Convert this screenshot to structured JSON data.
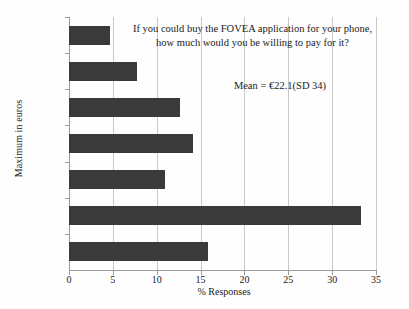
{
  "chart_data": {
    "type": "bar",
    "orientation": "horizontal",
    "title": "",
    "xlabel": "% Responses",
    "ylabel": "Maximum in euros",
    "categories": [
      "0",
      "1–5",
      "6–10",
      "11–20",
      "21–30",
      "31–70",
      "71–175"
    ],
    "values": [
      15.9,
      33.3,
      11.0,
      14.1,
      12.7,
      7.8,
      4.7
    ],
    "xlim": [
      0,
      35
    ],
    "xticks": [
      "0",
      "5",
      "10",
      "15",
      "20",
      "25",
      "30",
      "35"
    ],
    "xtick_values": [
      0,
      5,
      10,
      15,
      20,
      25,
      30,
      35
    ],
    "grid": "vertical",
    "legend": "none",
    "bar_color": "#3a3a3a",
    "grid_color": "#c9c9c9",
    "axis_color": "#9a9a9a",
    "annotations": [
      {
        "name": "survey-question",
        "line1": "If you could buy the FOVEA application for your phone,",
        "line2": "how much would you be willing to pay for it?"
      },
      {
        "name": "mean-statistic",
        "text": "Mean = €22.1(SD 34)"
      }
    ]
  }
}
